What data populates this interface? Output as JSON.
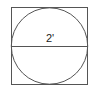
{
  "diagram": {
    "shape": "circle inscribed in square",
    "diameter_label": "2'",
    "colors": {
      "stroke": "#555555",
      "background": "#ffffff",
      "text": "#222222"
    }
  }
}
